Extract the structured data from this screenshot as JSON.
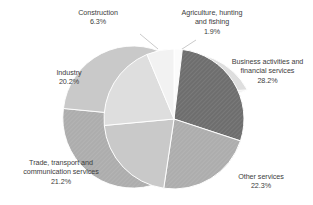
{
  "chart_data": {
    "type": "pie",
    "title": "",
    "subtitle": "",
    "xlabel": "",
    "ylabel": "",
    "grid": false,
    "legend_position": "none",
    "label_format": "name + percent",
    "start_angle_deg": 0,
    "direction": "clockwise",
    "categories": [
      "Agriculture, hunting and fishing",
      "Business activities and financial services",
      "Other services",
      "Trade, transport and communication services",
      "Industry",
      "Construction"
    ],
    "values": [
      1.9,
      28.2,
      22.3,
      21.2,
      20.2,
      6.3
    ],
    "units": "percent",
    "slices": [
      {
        "name": "Agriculture, hunting and fishing",
        "line1": "Agriculture, hunting",
        "line2": "and fishing",
        "percent": 1.9,
        "percent_label": "1.9%",
        "color": "#fbfbfb"
      },
      {
        "name": "Business activities and financial services",
        "line1": "Business activities and",
        "line2": "financial services",
        "percent": 28.2,
        "percent_label": "28.2%",
        "color": "#6e6e6e"
      },
      {
        "name": "Other services",
        "line1": "Other services",
        "line2": "",
        "percent": 22.3,
        "percent_label": "22.3%",
        "color": "#adadad"
      },
      {
        "name": "Trade, transport and communication services",
        "line1": "Trade, transport and",
        "line2": "communication services",
        "percent": 21.2,
        "percent_label": "21.2%",
        "color": "#c9c9c9"
      },
      {
        "name": "Industry",
        "line1": "Industry",
        "line2": "",
        "percent": 20.2,
        "percent_label": "20.2%",
        "color": "#dedede"
      },
      {
        "name": "Construction",
        "line1": "Construction",
        "line2": "",
        "percent": 6.3,
        "percent_label": "6.3%",
        "color": "#f2f2f2"
      }
    ]
  }
}
